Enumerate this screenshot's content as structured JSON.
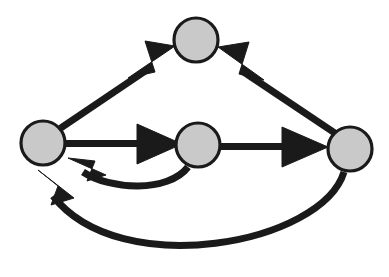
{
  "diagram": {
    "background_color": "#ffffff",
    "node_fill_color": "#c9c9c9",
    "node_stroke_color": "#1a1a1a",
    "edge_color": "#1a1a1a",
    "edge_stroke_width": 7,
    "node_radius": 22,
    "node_count": 4,
    "edge_count": 6
  },
  "chart_data": {
    "type": "diagram",
    "graph_type": "directed-graph",
    "title": "",
    "nodes": [
      {
        "id": "left",
        "label": "",
        "cx": 43,
        "cy": 143,
        "r": 22
      },
      {
        "id": "top",
        "label": "",
        "cx": 196,
        "cy": 40,
        "r": 22
      },
      {
        "id": "middle",
        "label": "",
        "cx": 198,
        "cy": 145,
        "r": 22
      },
      {
        "id": "right",
        "label": "",
        "cx": 350,
        "cy": 149,
        "r": 22
      }
    ],
    "edges": [
      {
        "id": "e1",
        "from": "left",
        "to": "top",
        "label": "",
        "shape": "straight",
        "direction": "up-right"
      },
      {
        "id": "e2",
        "from": "right",
        "to": "top",
        "label": "",
        "shape": "straight",
        "direction": "up-left"
      },
      {
        "id": "e3",
        "from": "left",
        "to": "middle",
        "label": "",
        "shape": "straight",
        "direction": "right"
      },
      {
        "id": "e4",
        "from": "middle",
        "to": "right",
        "label": "",
        "shape": "straight",
        "direction": "right"
      },
      {
        "id": "e5",
        "from": "middle",
        "to": "left",
        "label": "",
        "shape": "curved-below",
        "direction": "left"
      },
      {
        "id": "e6",
        "from": "right",
        "to": "left",
        "label": "",
        "shape": "curved-below-long",
        "direction": "left"
      }
    ]
  },
  "geometry": {
    "edges": {
      "left_to_top": {
        "path": "M 60.6 128.2 L 151 67.2",
        "arrow": "128,78 175,46 145,41 155,72"
      },
      "right_to_top": {
        "path": "M 336.5 134.2 L 243 71.5",
        "arrow": "264,80 218,47 249,42 239,74"
      },
      "left_to_middle": {
        "path": "M 65 143.5 L 146 143.5",
        "arrow": "137,124 182,144 137,164"
      },
      "middle_to_right": {
        "path": "M 220 146.5 L 291 146.5",
        "arrow": "282,127 328,147 282,167"
      },
      "middle_to_left": {
        "path": "M 188 167 C 168 193, 110 190, 83 172",
        "arrow": "68,158 106,175 87,181 95,161"
      },
      "right_to_left": {
        "path": "M 344 172 C 322 244, 120 282, 53 196",
        "arrow": "38,170 74,198 51,205 58,186"
      }
    },
    "nodes": {
      "left": {
        "cx": 43,
        "cy": 143,
        "r": 22
      },
      "top": {
        "cx": 196,
        "cy": 40,
        "r": 22
      },
      "middle": {
        "cx": 198,
        "cy": 145,
        "r": 22
      },
      "right": {
        "cx": 350,
        "cy": 149,
        "r": 22
      }
    }
  }
}
